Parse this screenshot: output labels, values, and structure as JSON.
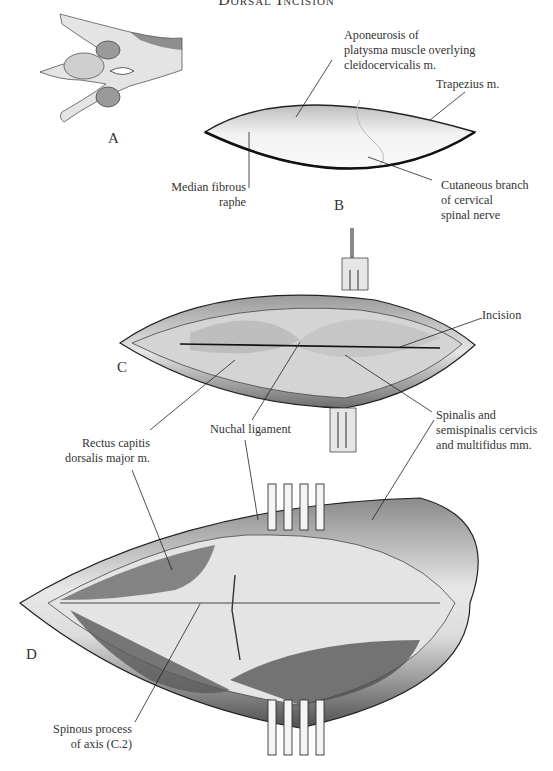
{
  "title": "Dorsal Incision",
  "panels": [
    {
      "letter": "A"
    },
    {
      "letter": "B"
    },
    {
      "letter": "C"
    },
    {
      "letter": "D"
    }
  ],
  "labels": {
    "aponeurosis": [
      "Aponeurosis of",
      "platysma muscle overlying",
      "cleidocervicalis m."
    ],
    "trapezius": [
      "Trapezius m."
    ],
    "median_raphe": [
      "Median fibrous",
      "raphe"
    ],
    "cutaneous_branch": [
      "Cutaneous branch",
      "of cervical",
      "spinal nerve"
    ],
    "incision": [
      "Incision"
    ],
    "rectus_capitis": [
      "Rectus capitis",
      "dorsalis major m."
    ],
    "nuchal_ligament": [
      "Nuchal ligament"
    ],
    "spinalis": [
      "Spinalis and",
      "semispinalis cervicis",
      "and multifidus mm."
    ],
    "spinous_process": [
      "Spinous process",
      "of axis (C.2)"
    ]
  }
}
